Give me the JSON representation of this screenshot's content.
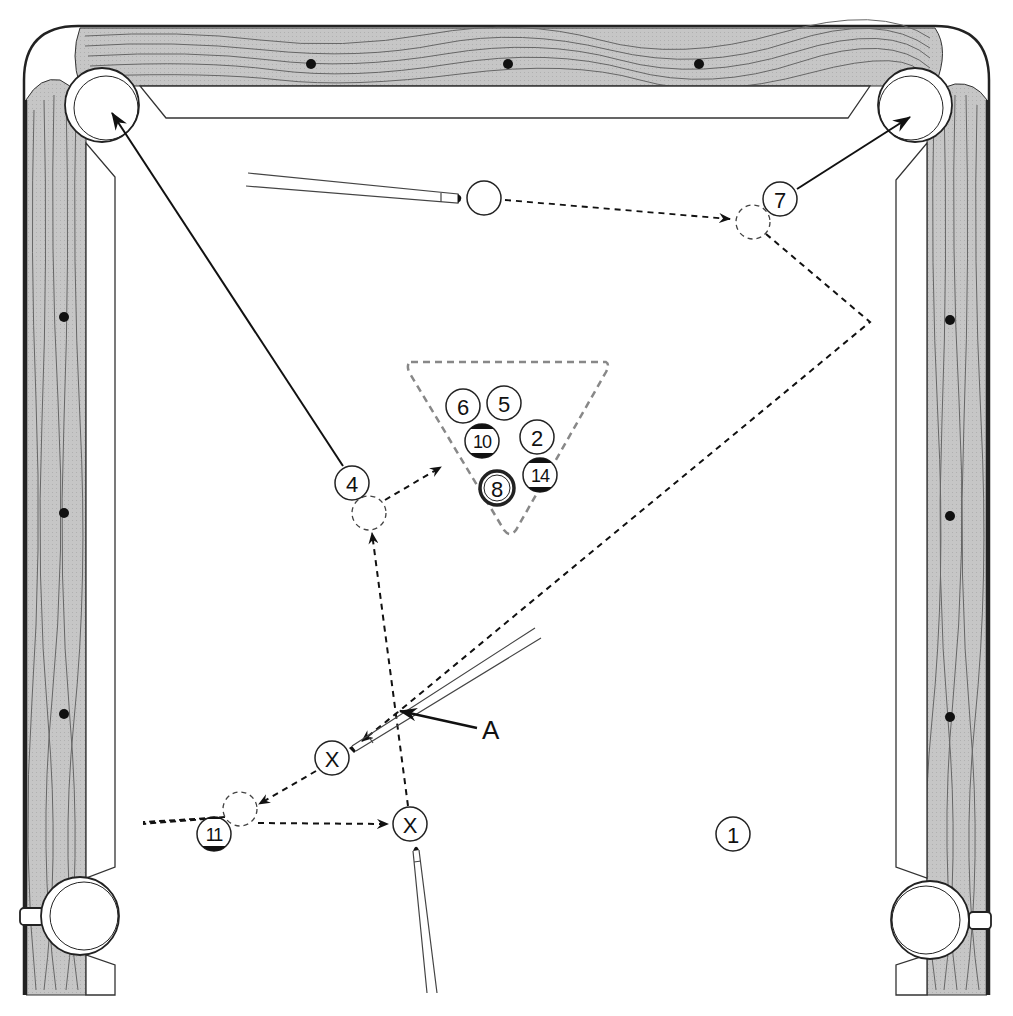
{
  "diagram": {
    "colors": {
      "rail_wood": "#c8c8c8",
      "grain": "#666666",
      "outline": "#222222",
      "cloth": "#ffffff",
      "dash": "#222222",
      "rack_dash": "#888888"
    },
    "balls": [
      {
        "id": "ball-cue",
        "label": "",
        "x": 484,
        "y": 198,
        "type": "cue"
      },
      {
        "id": "ball-7",
        "label": "7",
        "x": 780,
        "y": 199,
        "type": "solid"
      },
      {
        "id": "ball-4",
        "label": "4",
        "x": 352,
        "y": 483,
        "type": "solid"
      },
      {
        "id": "ball-6",
        "label": "6",
        "x": 463,
        "y": 406,
        "type": "solid"
      },
      {
        "id": "ball-5",
        "label": "5",
        "x": 504,
        "y": 403,
        "type": "solid"
      },
      {
        "id": "ball-10",
        "label": "10",
        "x": 482,
        "y": 441,
        "type": "stripe"
      },
      {
        "id": "ball-2",
        "label": "2",
        "x": 537,
        "y": 437,
        "type": "solid"
      },
      {
        "id": "ball-14",
        "label": "14",
        "x": 540,
        "y": 475,
        "type": "stripe"
      },
      {
        "id": "ball-8",
        "label": "8",
        "x": 497,
        "y": 488,
        "type": "eight"
      },
      {
        "id": "ball-11",
        "label": "11",
        "x": 214,
        "y": 834,
        "type": "stripe"
      },
      {
        "id": "ball-1",
        "label": "1",
        "x": 733,
        "y": 834,
        "type": "solid"
      },
      {
        "id": "cue-position-x1",
        "label": "X",
        "x": 332,
        "y": 758,
        "type": "solid"
      },
      {
        "id": "cue-position-x2",
        "label": "X",
        "x": 410,
        "y": 824,
        "type": "solid"
      }
    ],
    "ghost_balls": [
      {
        "id": "ghost-7",
        "x": 753,
        "y": 222
      },
      {
        "id": "ghost-4",
        "x": 369,
        "y": 513
      },
      {
        "id": "ghost-11",
        "x": 240,
        "y": 809
      }
    ],
    "annotations": [
      {
        "id": "label-a",
        "text": "A",
        "x": 482,
        "y": 739
      }
    ],
    "diamonds": {
      "top": [
        [
          311,
          64
        ],
        [
          508,
          64
        ],
        [
          699,
          64
        ]
      ],
      "left": [
        [
          64,
          317
        ],
        [
          64,
          513
        ],
        [
          64,
          714
        ]
      ],
      "right": [
        [
          950,
          320
        ],
        [
          950,
          516
        ],
        [
          950,
          717
        ]
      ]
    }
  }
}
